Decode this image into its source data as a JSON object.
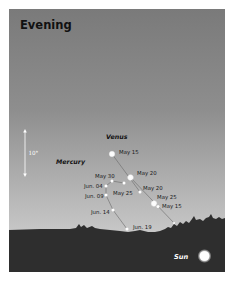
{
  "title": "Evening",
  "scale": {
    "label": "10°"
  },
  "planets": {
    "venus": {
      "name": "Venus",
      "dates": [
        "May 15",
        "May 20",
        "May 25"
      ]
    },
    "mercury": {
      "name": "Mercury",
      "dates": [
        "May 25",
        "May 30",
        "Jun. 04",
        "Jun. 09",
        "Jun. 14",
        "Jun. 19"
      ]
    },
    "other": {
      "dates": [
        "May 20",
        "May 25",
        "May 15"
      ]
    }
  },
  "sun": {
    "label": "Sun"
  },
  "colors": {
    "sky_top": "#7b7b7b",
    "sky_horizon": "#c6c6c6",
    "ground": "#2e2e2e",
    "object": "#ffffff"
  }
}
